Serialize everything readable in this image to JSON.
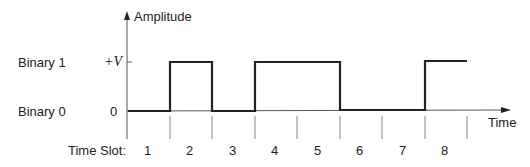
{
  "diagram": {
    "y_axis_label": "Amplitude",
    "x_axis_label": "Time",
    "levels": [
      {
        "name": "Binary 1",
        "value_label": "+V"
      },
      {
        "name": "Binary 0",
        "value_label": "0"
      }
    ],
    "time_slot_label": "Time Slot:",
    "slots": [
      "1",
      "2",
      "3",
      "4",
      "5",
      "6",
      "7",
      "8"
    ],
    "bits": [
      0,
      1,
      0,
      1,
      1,
      0,
      0,
      1
    ]
  }
}
